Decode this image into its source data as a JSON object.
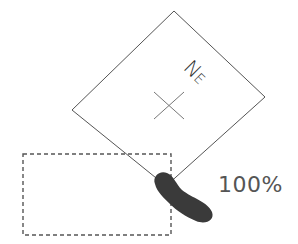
{
  "diagram": {
    "rotated_frame": {
      "corners": {
        "top": [
          174,
          11
        ],
        "right": [
          265,
          97
        ],
        "bottom": [
          166,
          186
        ],
        "left": [
          72,
          110
        ]
      },
      "stroke": "#555555"
    },
    "center_marker": {
      "type": "cross",
      "center": [
        169,
        106
      ],
      "stroke": "#777777"
    },
    "direction_label": {
      "n": "N",
      "e": "E",
      "full": "NE"
    },
    "dashed_outline": {
      "x": 23,
      "y": 154,
      "width": 148,
      "height": 81,
      "stroke": "#555555"
    },
    "finger_touch": {
      "fill": "#3a3a3a"
    },
    "scale_label": "100%"
  }
}
